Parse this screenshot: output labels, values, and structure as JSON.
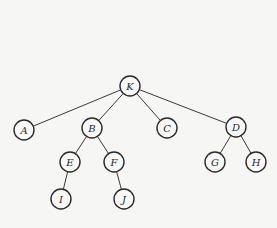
{
  "diagram": {
    "type": "tree",
    "colors": {
      "background": "#f6f6f5",
      "stroke": "#2a2a2a",
      "node_fill": "#f8f8f7"
    },
    "node_radius": 10,
    "nodes": [
      {
        "id": "K",
        "label": "K",
        "x": 130,
        "y": 86
      },
      {
        "id": "A",
        "label": "A",
        "x": 24,
        "y": 130
      },
      {
        "id": "B",
        "label": "B",
        "x": 92,
        "y": 128
      },
      {
        "id": "C",
        "label": "C",
        "x": 167,
        "y": 128
      },
      {
        "id": "D",
        "label": "D",
        "x": 236,
        "y": 127
      },
      {
        "id": "E",
        "label": "E",
        "x": 70,
        "y": 162
      },
      {
        "id": "F",
        "label": "F",
        "x": 114,
        "y": 162
      },
      {
        "id": "G",
        "label": "G",
        "x": 215,
        "y": 162
      },
      {
        "id": "H",
        "label": "H",
        "x": 256,
        "y": 162
      },
      {
        "id": "I",
        "label": "I",
        "x": 61,
        "y": 199
      },
      {
        "id": "J",
        "label": "J",
        "x": 124,
        "y": 199
      }
    ],
    "edges": [
      {
        "from": "K",
        "to": "A"
      },
      {
        "from": "K",
        "to": "B"
      },
      {
        "from": "K",
        "to": "C"
      },
      {
        "from": "K",
        "to": "D"
      },
      {
        "from": "B",
        "to": "E"
      },
      {
        "from": "B",
        "to": "F"
      },
      {
        "from": "D",
        "to": "G"
      },
      {
        "from": "D",
        "to": "H"
      },
      {
        "from": "E",
        "to": "I"
      },
      {
        "from": "F",
        "to": "J"
      }
    ]
  }
}
